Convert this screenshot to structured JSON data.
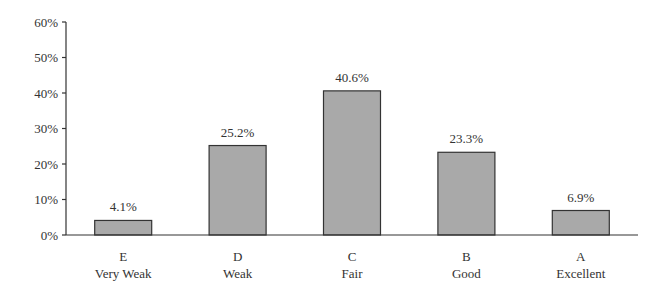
{
  "chart_data": {
    "type": "bar",
    "title": "",
    "xlabel": "",
    "ylabel": "",
    "categories": [
      "E\nVery Weak",
      "D\nWeak",
      "C\nFair",
      "B\nGood",
      "A\nExcellent"
    ],
    "category_codes": [
      "E",
      "D",
      "C",
      "B",
      "A"
    ],
    "category_names": [
      "Very Weak",
      "Weak",
      "Fair",
      "Good",
      "Excellent"
    ],
    "values": [
      4.1,
      25.2,
      40.6,
      23.3,
      6.9
    ],
    "data_labels": [
      "4.1%",
      "25.2%",
      "40.6%",
      "23.3%",
      "6.9%"
    ],
    "ylim": [
      0,
      60
    ],
    "yticks": [
      0,
      10,
      20,
      30,
      40,
      50,
      60
    ],
    "ytick_labels": [
      "0%",
      "10%",
      "20%",
      "30%",
      "40%",
      "50%",
      "60%"
    ],
    "grid": false,
    "legend": null,
    "colors": {
      "bar_fill": "#a9a9a9",
      "bar_stroke": "#333333",
      "axis": "#333333"
    }
  }
}
